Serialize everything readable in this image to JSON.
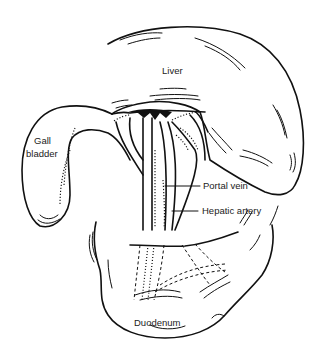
{
  "figure": {
    "labels": {
      "liver": "Liver",
      "gall_bladder_line1": "Gall",
      "gall_bladder_line2": "bladder",
      "portal_vein": "Portal vein",
      "hepatic_artery": "Hepatic artery",
      "duodenum": "Duodenum"
    },
    "ink_color": "#111111",
    "background_color": "#ffffff"
  }
}
